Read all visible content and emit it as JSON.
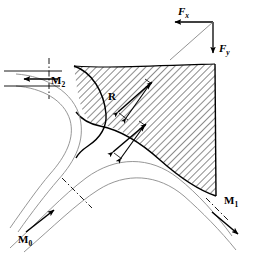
{
  "figure": {
    "type": "engineering-free-body-diagram",
    "background_color": "#ffffff",
    "line_color": "#000000",
    "hatch_color": "#000000",
    "thin_line_color": "#888888"
  },
  "labels": {
    "force_x": {
      "base": "F",
      "subscript": "x",
      "text": "Fx"
    },
    "force_y": {
      "base": "F",
      "subscript": "y",
      "text": "Fy"
    },
    "reaction": {
      "base": "R",
      "subscript": "",
      "text": "R"
    },
    "momentum_inlet": {
      "base": "M",
      "subscript": "0",
      "text": "M0"
    },
    "momentum_outlet_1": {
      "base": "M",
      "subscript": "1",
      "text": "M1"
    },
    "momentum_outlet_2": {
      "base": "M",
      "subscript": "2",
      "text": "M2"
    }
  },
  "annotations": {
    "arrows": [
      {
        "name": "fx-arrow",
        "label": "Fx",
        "direction": "left",
        "kind": "single-head"
      },
      {
        "name": "fy-arrow",
        "label": "Fy",
        "direction": "down",
        "kind": "single-head"
      },
      {
        "name": "resultant-line",
        "label": "",
        "direction": "diagonal",
        "kind": "plain-line"
      },
      {
        "name": "m2-arrow",
        "label": "M2",
        "direction": "left",
        "kind": "single-head"
      },
      {
        "name": "m0-arrow",
        "label": "M0",
        "direction": "up-right",
        "kind": "single-head"
      },
      {
        "name": "m1-arrow",
        "label": "M1",
        "direction": "down-right",
        "kind": "single-head"
      },
      {
        "name": "reaction-arrow-upper",
        "label": "R",
        "direction": "double",
        "kind": "double-head-pair"
      },
      {
        "name": "reaction-arrow-lower",
        "label": "",
        "direction": "double",
        "kind": "double-head-pair"
      }
    ],
    "centerlines": [
      {
        "name": "m2-centerline",
        "style": "dash-dot",
        "orientation": "vertical"
      },
      {
        "name": "m0-section-line",
        "style": "dash-dot",
        "orientation": "diagonal"
      },
      {
        "name": "m1-section-line",
        "style": "dash-dot",
        "orientation": "diagonal"
      }
    ]
  }
}
